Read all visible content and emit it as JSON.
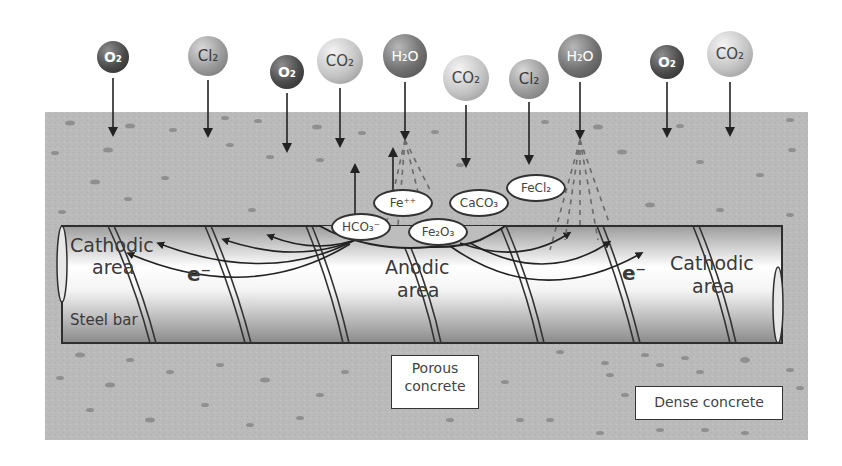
{
  "diagram": {
    "molecules": [
      {
        "id": "o2-1",
        "label": "O₂",
        "x": 113,
        "y": 57,
        "r": 16,
        "style": "dark"
      },
      {
        "id": "cl2-1",
        "label": "Cl₂",
        "x": 208,
        "y": 56,
        "r": 20,
        "style": "mid"
      },
      {
        "id": "o2-2",
        "label": "O₂",
        "x": 287,
        "y": 72,
        "r": 17,
        "style": "dark"
      },
      {
        "id": "co2-1",
        "label": "CO₂",
        "x": 340,
        "y": 61,
        "r": 23,
        "style": "light"
      },
      {
        "id": "h2o-1",
        "label": "H₂O",
        "x": 405,
        "y": 56,
        "r": 22,
        "style": "h2o"
      },
      {
        "id": "co2-2",
        "label": "CO₂",
        "x": 466,
        "y": 78,
        "r": 23,
        "style": "light"
      },
      {
        "id": "cl2-2",
        "label": "Cl₂",
        "x": 529,
        "y": 79,
        "r": 20,
        "style": "mid"
      },
      {
        "id": "h2o-2",
        "label": "H₂O",
        "x": 580,
        "y": 56,
        "r": 22,
        "style": "h2o"
      },
      {
        "id": "o2-3",
        "label": "O₂",
        "x": 667,
        "y": 62,
        "r": 17,
        "style": "dark"
      },
      {
        "id": "co2-3",
        "label": "CO₂",
        "x": 730,
        "y": 54,
        "r": 23,
        "style": "light"
      }
    ],
    "ions": [
      {
        "id": "hco3",
        "label": "HCO₃⁻",
        "x": 360,
        "y": 226,
        "w": 58,
        "h": 26
      },
      {
        "id": "fe2",
        "label": "Fe⁺⁺",
        "x": 402,
        "y": 202,
        "w": 58,
        "h": 26
      },
      {
        "id": "fe2o3",
        "label": "Fe₂O₃",
        "x": 437,
        "y": 231,
        "w": 58,
        "h": 26
      },
      {
        "id": "caco3",
        "label": "CaCO₃",
        "x": 478,
        "y": 202,
        "w": 58,
        "h": 26
      },
      {
        "id": "fecl2",
        "label": "FeCl₂",
        "x": 535,
        "y": 187,
        "w": 58,
        "h": 26
      }
    ],
    "labels": {
      "cathodic_left_line1": "Cathodic",
      "cathodic_left_line2": "area",
      "cathodic_right_line1": "Cathodic",
      "cathodic_right_line2": "area",
      "anodic_line1": "Anodic",
      "anodic_line2": "area",
      "electron_left": "e⁻",
      "electron_right": "e⁻",
      "steel_bar": "Steel bar",
      "porous_concrete_line1": "Porous",
      "porous_concrete_line2": "concrete",
      "dense_concrete": "Dense concrete"
    },
    "colors": {
      "concrete": "#b9b9b9",
      "aggregate": "#8a8a8a",
      "bar_edge": "#2e2e2e",
      "text": "#3a3a3a",
      "background": "#ffffff"
    }
  }
}
